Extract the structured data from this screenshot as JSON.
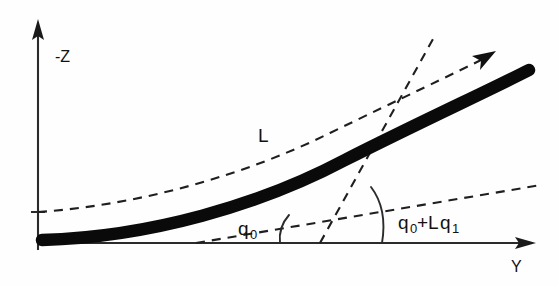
{
  "figure": {
    "type": "engineering-diagram",
    "background_color": "#fefefe",
    "ink_color": "#111111"
  },
  "axes": {
    "vertical": {
      "label": "-Z",
      "name": "negative-z-axis",
      "direction": "up",
      "x": 38,
      "y_top": 22,
      "y_bottom": 250,
      "label_x": 55,
      "label_y": 62
    },
    "horizontal": {
      "label": "Y",
      "name": "y-axis",
      "direction": "right",
      "y": 243,
      "x_left": 38,
      "x_right": 536,
      "label_x": 511,
      "label_y": 272
    },
    "tick": {
      "name": "z-axis-tick",
      "x_start": 31,
      "x_end": 45,
      "y": 212
    }
  },
  "curves": {
    "beam": {
      "name": "deflected-beam",
      "style": "thick-solid",
      "stroke_width": 12.5,
      "color": "#0a0a0a",
      "start": [
        40,
        240
      ],
      "end": [
        531,
        70
      ],
      "path": "M 40 240 C 150 237 260 205 345 160 C 420 122 490 90 531 70"
    },
    "tangent_reference": {
      "name": "reference-dashed-curve",
      "style": "dashed",
      "color": "#1f1f1f",
      "start": [
        38,
        212
      ],
      "end": [
        487,
        57
      ],
      "has_arrow": true,
      "arrow_at": [
        487,
        57
      ],
      "path": "M 38 212 C 140 205 245 175 330 133 C 400 99 455 73 487 57"
    }
  },
  "tangents": {
    "initial_slope_line": {
      "name": "initial-slope-dashed-line",
      "style": "dashed",
      "from": [
        200,
        243
      ],
      "to": [
        540,
        185
      ],
      "note": "shallow dashed line defining angle q0 at the support"
    },
    "final_slope_line": {
      "name": "final-slope-dashed-line",
      "style": "dashed",
      "from": [
        320,
        243
      ],
      "to": [
        432,
        40
      ],
      "note": "steep dashed line defining total end slope q0+Lq1"
    }
  },
  "angles": {
    "initial": {
      "name": "angle-q0",
      "label_text": "q",
      "label_sub": "0",
      "label_full": "q0",
      "label_x": 238,
      "label_y": 235,
      "arc": {
        "name": "angle-arc-q0",
        "vertex": [
          285,
          243
        ],
        "path": "M 288 216 C 280 224 278 234 279 243"
      }
    },
    "total": {
      "name": "angle-q0-plus-Lq1",
      "label_text": "q",
      "label_sub_1": "0",
      "label_mid": "+L",
      "label_text_2": "q",
      "label_sub_2": "1",
      "label_full": "q0+Lq1",
      "label_x": 398,
      "label_y": 229,
      "arc": {
        "name": "angle-arc-total",
        "vertex": [
          382,
          243
        ],
        "path": "M 372 188 C 385 205 385 225 382 243"
      }
    }
  },
  "labels": {
    "span": {
      "name": "beam-length-label",
      "text": "L",
      "x": 258,
      "y": 142
    },
    "vertical_axis": "-Z",
    "horizontal_axis": "Y"
  }
}
